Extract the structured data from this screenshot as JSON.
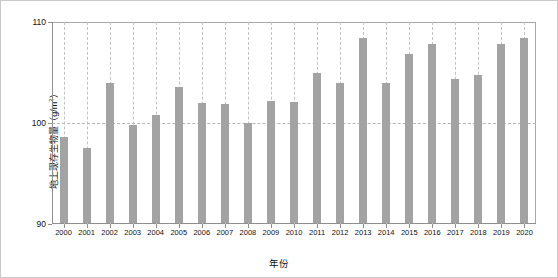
{
  "chart_data": {
    "type": "bar",
    "title": "",
    "xlabel": "年份",
    "ylabel": "地上现存生物量（g/m²）",
    "ylabel_text": "地上现存生物量（g/m",
    "ylabel_sup": "2",
    "ylabel_tail": "）",
    "ylim": [
      90,
      110
    ],
    "yticks": [
      90,
      100,
      110
    ],
    "ytick_labels": [
      "90",
      "100",
      "110"
    ],
    "grid": "vertical dashed gridlines at each year; horizontal dashed gridline at 100",
    "legend": "none",
    "bar_color": "#a3a3a3",
    "categories": [
      "2000",
      "2001",
      "2002",
      "2003",
      "2004",
      "2005",
      "2006",
      "2007",
      "2008",
      "2009",
      "2010",
      "2011",
      "2012",
      "2013",
      "2014",
      "2015",
      "2016",
      "2017",
      "2018",
      "2019",
      "2020"
    ],
    "values": [
      98.6,
      97.5,
      104.0,
      99.8,
      100.8,
      103.6,
      102.0,
      101.9,
      100.0,
      102.2,
      102.1,
      105.0,
      104.0,
      108.4,
      104.0,
      106.8,
      107.8,
      104.4,
      104.8,
      107.8,
      108.4
    ]
  },
  "axes": {
    "ylabel_full": "地上现存生物量（g/m²）",
    "xlabel_full": "年份"
  }
}
